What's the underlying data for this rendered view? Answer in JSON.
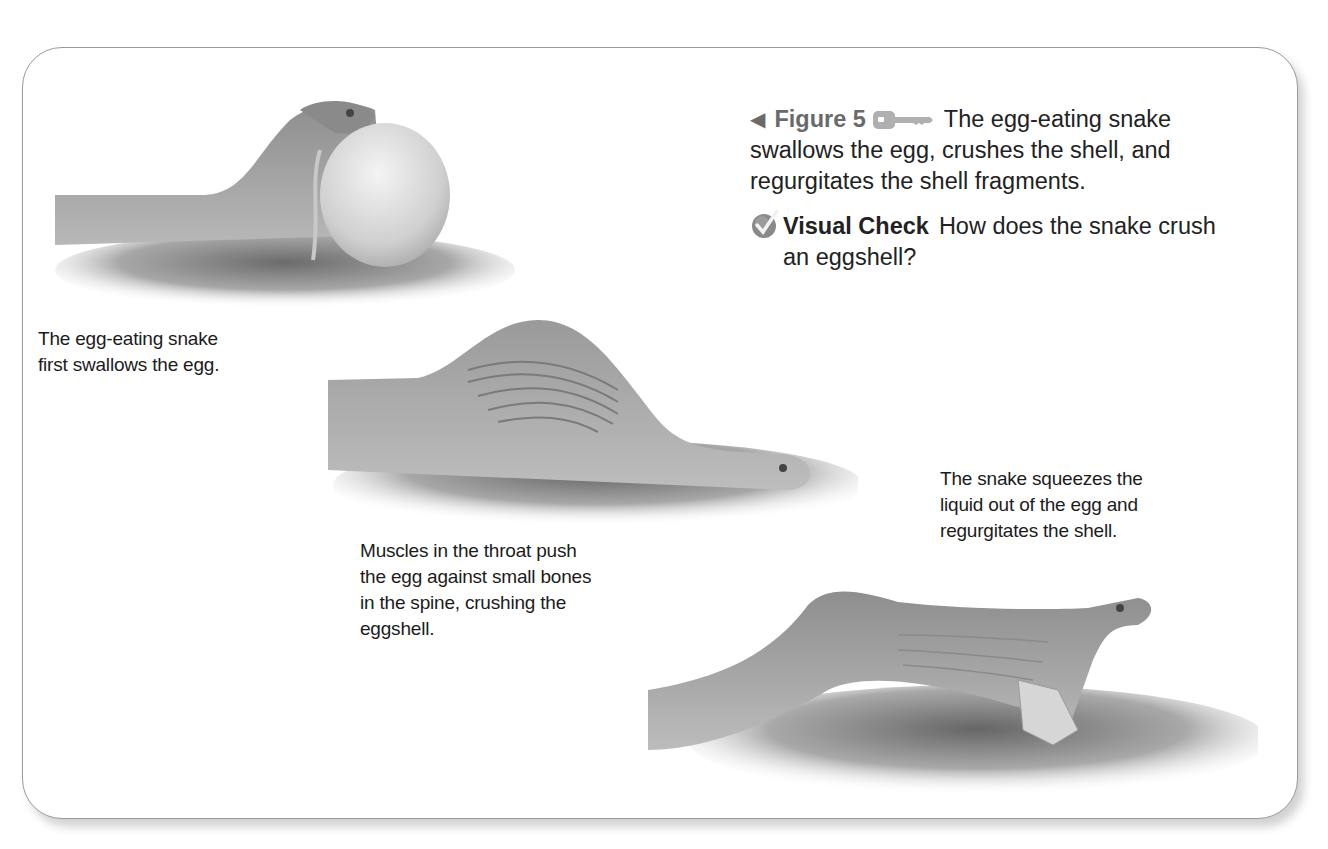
{
  "figure": {
    "number_label": "Figure 5",
    "caption": "The egg-eating snake swallows the egg, crushes the shell, and regurgitates the shell fragments.",
    "caption_line1": "The egg-eating snake",
    "caption_line2": "swallows the egg, crushes the shell, and",
    "caption_line3": "regurgitates the shell fragments.",
    "icons": {
      "pointer": "left-triangle-icon",
      "key": "key-icon"
    }
  },
  "visual_check": {
    "label": "Visual Check",
    "question_line1": "How does the snake crush",
    "question_line2": "an eggshell?",
    "icon": "checkmark-circle-icon"
  },
  "steps": [
    {
      "line1": "The egg-eating snake",
      "line2": "first swallows the egg."
    },
    {
      "line1": "Muscles in the throat push",
      "line2": "the egg against small bones",
      "line3": "in the spine, crushing the",
      "line4": "eggshell."
    },
    {
      "line1": "The snake squeezes the",
      "line2": "liquid out of the egg and",
      "line3": "regurgitates the shell."
    }
  ],
  "colors": {
    "frame_border": "#9a9a9a",
    "figure_label": "#6a6a6a",
    "text": "#1c1c1c"
  }
}
